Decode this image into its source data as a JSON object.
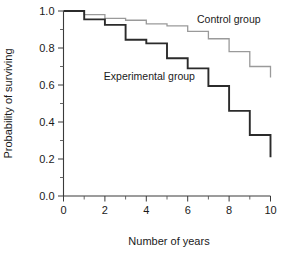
{
  "chart_data": {
    "type": "line",
    "title": "",
    "subtitle": "",
    "xlabel": "Number of years",
    "ylabel": "Probability of surviving",
    "xlim": [
      0,
      10
    ],
    "ylim": [
      0,
      1
    ],
    "grid": false,
    "legend_position": "inline-annotation",
    "x_major_ticks": [
      0,
      2,
      4,
      6,
      8,
      10
    ],
    "x_major_tick_labels": [
      "0",
      "2",
      "4",
      "6",
      "8",
      "10"
    ],
    "x_minor_ticks": [
      1,
      3,
      5,
      7,
      9
    ],
    "y_major_ticks": [
      0.0,
      0.2,
      0.4,
      0.6,
      0.8,
      1.0
    ],
    "y_major_tick_labels": [
      "0.0",
      "0.2",
      "0.4",
      "0.6",
      "0.8",
      "1.0"
    ],
    "y_minor_ticks": [
      0.1,
      0.3,
      0.5,
      0.7,
      0.9
    ],
    "step_mode": "post",
    "series": [
      {
        "name": "Control group",
        "label": "Control group",
        "color": "#9a9a9a",
        "stroke_width": 1.3,
        "x": [
          0,
          1,
          2,
          3,
          4,
          5,
          6,
          7,
          8,
          9,
          10
        ],
        "values": [
          1.0,
          0.98,
          0.96,
          0.95,
          0.93,
          0.92,
          0.89,
          0.85,
          0.78,
          0.7,
          0.64
        ],
        "annotation": {
          "text": "Control group",
          "x": 6.45,
          "y": 0.935
        }
      },
      {
        "name": "Experimental group",
        "label": "Experimental group",
        "color": "#2b2b2b",
        "stroke_width": 1.9,
        "x": [
          0,
          1,
          2,
          3,
          4,
          5,
          6,
          7,
          8,
          9,
          10
        ],
        "values": [
          1.0,
          0.955,
          0.925,
          0.845,
          0.825,
          0.745,
          0.69,
          0.595,
          0.46,
          0.33,
          0.21
        ],
        "annotation": {
          "text": "Experimental group",
          "x": 1.95,
          "y": 0.625
        }
      }
    ]
  },
  "axes": {
    "x_title": "Number of years",
    "y_title": "Probability of surviving"
  }
}
